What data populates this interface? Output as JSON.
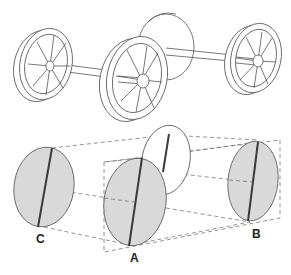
{
  "figure": {
    "top_panel": {
      "description": "Isometric axle assembly with three spoked wheels and a disc",
      "wheels": [
        {
          "id": "left-wheel",
          "spokes": 8
        },
        {
          "id": "middle-wheel",
          "spokes": 8
        },
        {
          "id": "right-wheel",
          "spokes": 8
        }
      ],
      "has_rear_disc": true
    },
    "bottom_panel": {
      "description": "Projection of three discs with diameter lines joined by dashed construction lines",
      "discs": [
        {
          "id": "C",
          "label": "C",
          "shaded": true
        },
        {
          "id": "A",
          "label": "A",
          "shaded": true
        },
        {
          "id": "B",
          "label": "B",
          "shaded": true
        },
        {
          "id": "ghost",
          "label": "",
          "shaded": false
        }
      ]
    },
    "colors": {
      "line": "#555555",
      "disc_fill": "#d9d9d9",
      "diameter_line": "#3a3a3a",
      "label": "#222222"
    }
  }
}
